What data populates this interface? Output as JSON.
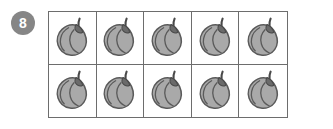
{
  "exercise": {
    "number": "8",
    "badge_color": "#868686",
    "badge_text_color": "#ffffff"
  },
  "grid": {
    "columns": 5,
    "rows": 2,
    "total_cells": 10,
    "border_color": "#6d6d6d",
    "background": "#ffffff",
    "cells": [
      {
        "icon": "pear-fruit-icon"
      },
      {
        "icon": "pear-fruit-icon"
      },
      {
        "icon": "pear-fruit-icon"
      },
      {
        "icon": "pear-fruit-icon"
      },
      {
        "icon": "pear-fruit-icon"
      },
      {
        "icon": "pear-fruit-icon"
      },
      {
        "icon": "pear-fruit-icon"
      },
      {
        "icon": "pear-fruit-icon"
      },
      {
        "icon": "pear-fruit-icon"
      },
      {
        "icon": "pear-fruit-icon"
      }
    ]
  },
  "icon_colors": {
    "fruit_fill": "#a9a9a9",
    "fruit_outline": "#5a5a5a",
    "fruit_highlight": "#c4c4c4",
    "stem_color": "#4a4a4a"
  },
  "page": {
    "background": "#ffffff"
  }
}
